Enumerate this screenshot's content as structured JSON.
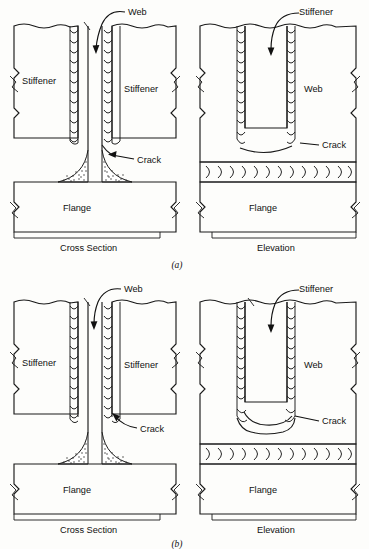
{
  "figure": {
    "background_color": "#fdfdfb",
    "line_color": "#1a1a1a"
  },
  "panels": [
    {
      "id": "a",
      "caption": "(a)",
      "description": "Stiffener welded to web, terminating near the web-to-flange fillet weld; crack at weld toe",
      "views": [
        {
          "id": "cross-section",
          "caption": "Cross Section",
          "labels": [
            {
              "name": "web",
              "text": "Web"
            },
            {
              "name": "stiffener-left",
              "text": "Stiffener"
            },
            {
              "name": "stiffener-right",
              "text": "Stiffener"
            },
            {
              "name": "crack",
              "text": "Crack"
            },
            {
              "name": "flange",
              "text": "Flange"
            }
          ]
        },
        {
          "id": "elevation",
          "caption": "Elevation",
          "labels": [
            {
              "name": "stiffener",
              "text": "Stiffener"
            },
            {
              "name": "web",
              "text": "Web"
            },
            {
              "name": "crack",
              "text": "Crack"
            },
            {
              "name": "flange",
              "text": "Flange"
            }
          ]
        }
      ]
    },
    {
      "id": "b",
      "caption": "(b)",
      "description": "Stiffener welded to web with weld wrapped around stiffener end, stopped short of flange; crack at weld toe",
      "views": [
        {
          "id": "cross-section",
          "caption": "Cross Section",
          "labels": [
            {
              "name": "web",
              "text": "Web"
            },
            {
              "name": "stiffener-left",
              "text": "Stiffener"
            },
            {
              "name": "stiffener-right",
              "text": "Stiffener"
            },
            {
              "name": "crack",
              "text": "Crack"
            },
            {
              "name": "flange",
              "text": "Flange"
            }
          ]
        },
        {
          "id": "elevation",
          "caption": "Elevation",
          "labels": [
            {
              "name": "stiffener",
              "text": "Stiffener"
            },
            {
              "name": "web",
              "text": "Web"
            },
            {
              "name": "crack",
              "text": "Crack"
            },
            {
              "name": "flange",
              "text": "Flange"
            }
          ]
        }
      ]
    }
  ]
}
